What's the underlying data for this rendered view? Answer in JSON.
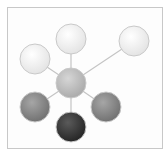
{
  "diagram": {
    "type": "hub-and-spoke",
    "frame_color": "#c8c8c8",
    "edge_color": "#c4c4c4",
    "hub": {
      "id": "hub",
      "cx": 71,
      "cy": 83,
      "r": 15,
      "fill": "#bdbdbd"
    },
    "nodes": [
      {
        "id": "top",
        "cx": 71,
        "cy": 39,
        "r": 15,
        "fill": "#ededed"
      },
      {
        "id": "top-right",
        "cx": 134,
        "cy": 41,
        "r": 15,
        "fill": "#ededed"
      },
      {
        "id": "upper-left",
        "cx": 35,
        "cy": 59,
        "r": 15,
        "fill": "#ededed"
      },
      {
        "id": "lower-left",
        "cx": 35,
        "cy": 107,
        "r": 15,
        "fill": "#8a8a8a"
      },
      {
        "id": "lower-right",
        "cx": 106,
        "cy": 107,
        "r": 15,
        "fill": "#8a8a8a"
      },
      {
        "id": "bottom",
        "cx": 71,
        "cy": 127,
        "r": 15,
        "fill": "#3c3c3c"
      }
    ]
  }
}
